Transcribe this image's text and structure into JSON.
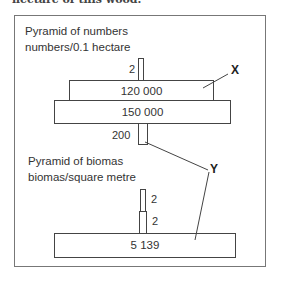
{
  "caption_top": "hectare of this wood.",
  "pyramid_numbers": {
    "title_line1": "Pyramid of numbers",
    "title_line2": "numbers/0.1 hectare",
    "levels": [
      {
        "value": "2",
        "label_position": "left"
      },
      {
        "value": "120 000"
      },
      {
        "value": "150 000"
      },
      {
        "value": "200",
        "label_position": "left"
      }
    ]
  },
  "pyramid_biomass": {
    "title_line1": "Pyramid of biomas",
    "title_line2": "biomas/square metre",
    "levels": [
      {
        "value": "2",
        "label_position": "right"
      },
      {
        "value": "2",
        "label_position": "right"
      },
      {
        "value": "5 139"
      }
    ]
  },
  "annotations": {
    "x_label": "X",
    "y_label": "Y"
  },
  "colors": {
    "line": "#444444",
    "frame": "#777777",
    "background": "#ffffff"
  }
}
